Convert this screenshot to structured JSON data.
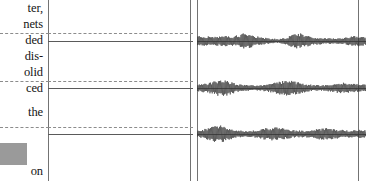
{
  "page": {
    "width": 366,
    "height": 181,
    "background": "#ffffff"
  },
  "text_column": {
    "name": "clipped-body-text",
    "lines": [
      {
        "text": "ter,",
        "top": 2
      },
      {
        "text": "nets",
        "top": 18
      },
      {
        "text": "ded",
        "top": 34
      },
      {
        "text": "dis-",
        "top": 50
      },
      {
        "text": "olid",
        "top": 66
      },
      {
        "text": "ced",
        "top": 82
      },
      {
        "text": "the",
        "top": 106
      },
      {
        "text": "on",
        "top": 165
      }
    ]
  },
  "gray_block": {
    "name": "figure-thumbnail",
    "color": "#9a9a9a",
    "left": 0,
    "top": 143,
    "width": 27,
    "height": 22
  },
  "rules": {
    "vertical": [
      {
        "name": "gutter-rule",
        "left": 48,
        "color": "#737373"
      },
      {
        "name": "axis-line-a",
        "left": 190,
        "color": "#737373"
      },
      {
        "name": "axis-line-b",
        "left": 197,
        "color": "#737373"
      },
      {
        "name": "right-border",
        "left": 358,
        "color": "#737373"
      }
    ],
    "horizontal_pairs": [
      {
        "name": "guide-pair-1",
        "dashed_top": 33,
        "solid_top": 41
      },
      {
        "name": "guide-pair-2",
        "dashed_top": 81,
        "solid_top": 88
      },
      {
        "name": "guide-pair-3",
        "dashed_top": 127,
        "solid_top": 134
      }
    ],
    "dashed_color": "#8c8c8c",
    "solid_color": "#5a5a5a"
  },
  "chart_data": {
    "type": "line",
    "title": "",
    "subtitle": "",
    "xlabel": "",
    "ylabel": "",
    "legend": [],
    "grid": false,
    "axis_range_x": [
      197,
      366
    ],
    "series": [
      {
        "name": "trace-1",
        "baseline_y": 41,
        "amplitude": 9,
        "samples": 300,
        "envelope": [
          0.55,
          0.58,
          0.52,
          0.6,
          0.57,
          0.5,
          0.62,
          0.55,
          0.48,
          0.58,
          0.54,
          0.61,
          0.5,
          0.57,
          0.63,
          0.52,
          0.59,
          0.55,
          0.66,
          0.6,
          0.72,
          0.85,
          0.95,
          1.0,
          0.92,
          0.8,
          0.7,
          0.62,
          0.55,
          0.5,
          0.45,
          0.4,
          0.36,
          0.33,
          0.3,
          0.28,
          0.26,
          0.25,
          0.24,
          0.26,
          0.3,
          0.36,
          0.44,
          0.54,
          0.66,
          0.78,
          0.88,
          0.94,
          0.9,
          0.82,
          0.74,
          0.66,
          0.6,
          0.55,
          0.5,
          0.46,
          0.43,
          0.4,
          0.38,
          0.36,
          0.34,
          0.33,
          0.32,
          0.31,
          0.3,
          0.3,
          0.31,
          0.33,
          0.36,
          0.4,
          0.45,
          0.5,
          0.54,
          0.57,
          0.59,
          0.6,
          0.6,
          0.58,
          0.56,
          0.54
        ]
      },
      {
        "name": "trace-2",
        "baseline_y": 88,
        "amplitude": 9,
        "samples": 300,
        "envelope": [
          0.4,
          0.45,
          0.42,
          0.5,
          0.47,
          0.55,
          0.6,
          0.68,
          0.76,
          0.84,
          0.9,
          0.96,
          1.0,
          0.94,
          0.86,
          0.76,
          0.68,
          0.6,
          0.54,
          0.48,
          0.44,
          0.4,
          0.37,
          0.35,
          0.33,
          0.32,
          0.31,
          0.3,
          0.3,
          0.31,
          0.33,
          0.35,
          0.38,
          0.42,
          0.47,
          0.52,
          0.58,
          0.64,
          0.7,
          0.75,
          0.79,
          0.82,
          0.84,
          0.84,
          0.82,
          0.78,
          0.73,
          0.68,
          0.62,
          0.56,
          0.51,
          0.46,
          0.42,
          0.39,
          0.36,
          0.34,
          0.33,
          0.32,
          0.32,
          0.33,
          0.35,
          0.38,
          0.42,
          0.46,
          0.5,
          0.54,
          0.57,
          0.59,
          0.6,
          0.6,
          0.58,
          0.56,
          0.53,
          0.5,
          0.47,
          0.44,
          0.42,
          0.4,
          0.39,
          0.38
        ]
      },
      {
        "name": "trace-3",
        "baseline_y": 134,
        "amplitude": 9,
        "samples": 300,
        "envelope": [
          0.35,
          0.4,
          0.46,
          0.54,
          0.63,
          0.72,
          0.8,
          0.88,
          0.94,
          0.98,
          1.0,
          0.96,
          0.9,
          0.82,
          0.74,
          0.66,
          0.58,
          0.52,
          0.47,
          0.43,
          0.4,
          0.38,
          0.36,
          0.35,
          0.35,
          0.36,
          0.38,
          0.41,
          0.45,
          0.5,
          0.55,
          0.6,
          0.65,
          0.69,
          0.72,
          0.74,
          0.75,
          0.74,
          0.72,
          0.69,
          0.65,
          0.61,
          0.57,
          0.53,
          0.49,
          0.46,
          0.43,
          0.41,
          0.39,
          0.38,
          0.38,
          0.39,
          0.41,
          0.44,
          0.48,
          0.52,
          0.56,
          0.6,
          0.63,
          0.65,
          0.66,
          0.65,
          0.63,
          0.6,
          0.57,
          0.54,
          0.51,
          0.48,
          0.46,
          0.44,
          0.43,
          0.42,
          0.42,
          0.43,
          0.44,
          0.45,
          0.46,
          0.46,
          0.45,
          0.44
        ]
      }
    ],
    "trace_color": "#333333"
  }
}
